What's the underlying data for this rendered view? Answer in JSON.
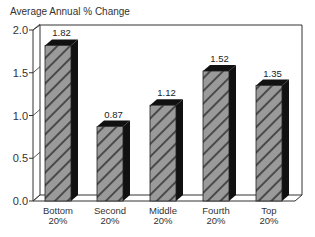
{
  "chart_data": {
    "type": "bar",
    "title": "Average Annual % Change",
    "xlabel": "",
    "ylabel": "Average Annual % Change",
    "categories": [
      "Bottom 20%",
      "Second 20%",
      "Middle 20%",
      "Fourth 20%",
      "Top 20%"
    ],
    "category_lines": [
      [
        "Bottom",
        "20%"
      ],
      [
        "Second",
        "20%"
      ],
      [
        "Middle",
        "20%"
      ],
      [
        "Fourth",
        "20%"
      ],
      [
        "Top",
        "20%"
      ]
    ],
    "values": [
      1.82,
      0.87,
      1.12,
      1.52,
      1.35
    ],
    "value_labels": [
      "1.82",
      "0.87",
      "1.12",
      "1.52",
      "1.35"
    ],
    "ylim": [
      0,
      2.0
    ],
    "yticks": [
      0.0,
      0.5,
      1.0,
      1.5,
      2.0
    ],
    "ytick_labels": [
      "0.0",
      "0.5",
      "1.0",
      "1.5",
      "2.0"
    ],
    "grid": false,
    "legend": null,
    "style": "3d-bars-hatched",
    "colors": {
      "bar_face": "#9a9a9a",
      "bar_hatch": "#444444",
      "bar_side": "#111111",
      "axis": "#333333"
    }
  }
}
